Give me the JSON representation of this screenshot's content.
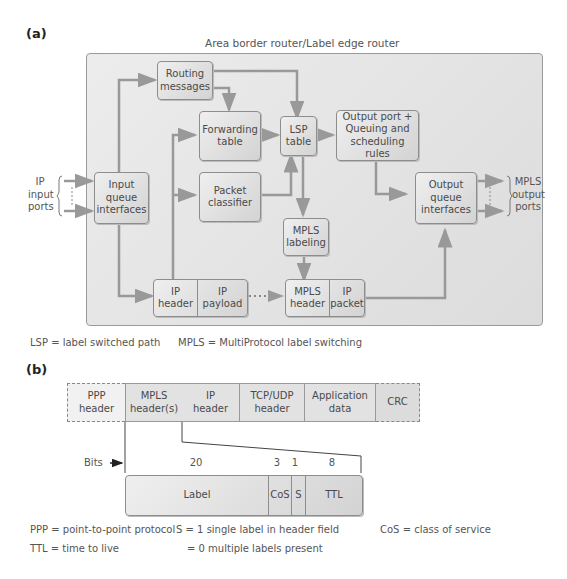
{
  "part_a": {
    "tag": "(a)",
    "router_title": "Area border router/Label edge router",
    "input_ports_label": "IP\ninput\nports",
    "output_ports_label": "MPLS\noutput\nports",
    "boxes": {
      "routing_messages": "Routing\nmessages",
      "forwarding_table": "Forwarding\ntable",
      "packet_classifier": "Packet\nclassifier",
      "lsp_table": "LSP\ntable",
      "output_port_rules": "Output port +\nQueuing and\nscheduling rules",
      "input_queue": "Input\nqueue\ninterfaces",
      "output_queue": "Output\nqueue\ninterfaces",
      "mpls_labeling": "MPLS\nlabeling",
      "ip_header": "IP\nheader",
      "ip_payload": "IP\npayload",
      "mpls_header": "MPLS\nheader",
      "ip_packet": "IP packet"
    },
    "legend_lsp": "LSP = label switched path",
    "legend_mpls": "MPLS = MultiProtocol label switching"
  },
  "part_b": {
    "tag": "(b)",
    "frame_fields": [
      {
        "label": "PPP\nheader",
        "dashed": true
      },
      {
        "label": "MPLS\nheader(s)",
        "dashed": false
      },
      {
        "label": "IP\nheader",
        "dashed": false
      },
      {
        "label": "TCP/UDP\nheader",
        "dashed": false
      },
      {
        "label": "Application\ndata",
        "dashed": false
      },
      {
        "label": "CRC",
        "dashed": true
      }
    ],
    "bits_label": "Bits",
    "mpls_fields": [
      {
        "label": "Label",
        "bits": "20"
      },
      {
        "label": "CoS",
        "bits": "3"
      },
      {
        "label": "S",
        "bits": "1"
      },
      {
        "label": "TTL",
        "bits": "8"
      }
    ],
    "legend": {
      "ppp": "PPP = point-to-point protocol",
      "ttl": "TTL = time to live",
      "s1": "S = 1 single label in header field",
      "s0": "= 0 multiple labels present",
      "cos": "CoS = class of service"
    }
  },
  "colors": {
    "arrow": "#999999",
    "box_border": "#8d8d8d",
    "router_bg": "#e4e4e4"
  }
}
